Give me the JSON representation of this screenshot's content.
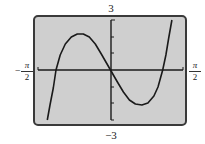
{
  "chart_data": {
    "type": "line",
    "title": "",
    "xlabel": "",
    "ylabel": "",
    "xlim": [
      -1.5708,
      1.5708
    ],
    "ylim": [
      -3,
      3
    ],
    "x_tick_labels": {
      "left": {
        "sign": "−",
        "num": "π",
        "den": "2"
      },
      "right": {
        "num": "π",
        "den": "2"
      }
    },
    "y_tick_labels": {
      "top": "3",
      "bottom": "−3"
    },
    "y_ticks": [
      -2,
      -1,
      1,
      2
    ],
    "grid": false,
    "legend": null,
    "series": [
      {
        "name": "f(x)",
        "x": [
          -1.37,
          -1.31,
          -1.24,
          -1.18,
          -1.09,
          -0.98,
          -0.85,
          -0.72,
          -0.59,
          -0.46,
          -0.33,
          -0.2,
          0.0,
          0.15,
          0.28,
          0.41,
          0.54,
          0.68,
          0.81,
          0.94,
          1.03,
          1.13,
          1.2,
          1.26,
          1.33
        ],
        "y": [
          -3.0,
          -2.1,
          -1.08,
          0.0,
          0.9,
          1.56,
          1.98,
          2.16,
          2.16,
          1.98,
          1.56,
          0.96,
          0.0,
          -0.72,
          -1.32,
          -1.8,
          -2.04,
          -2.1,
          -1.98,
          -1.56,
          -1.02,
          0.0,
          0.9,
          1.92,
          3.0
        ]
      }
    ],
    "plot_style": {
      "background": "#cfcfcf",
      "frame_color": "#3a3a3a",
      "curve_color": "#1a1a1a",
      "axis_color": "#1a1a1a"
    }
  }
}
